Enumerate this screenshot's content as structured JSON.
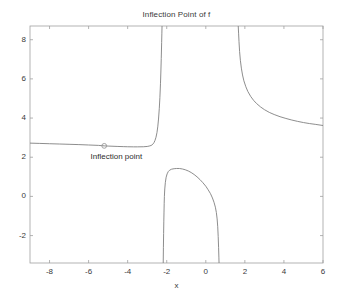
{
  "chart_data": {
    "type": "line",
    "title": "Inflection Point of f",
    "xlabel": "x",
    "ylabel": "",
    "xlim": [
      -9,
      6
    ],
    "ylim": [
      -3.4,
      8.7
    ],
    "grid": false,
    "legend": "none",
    "xticks": [
      -8,
      -6,
      -4,
      -2,
      0,
      2,
      4,
      6
    ],
    "xticklabels": [
      "-8",
      "-6",
      "-4",
      "-2",
      "0",
      "2",
      "4",
      "6"
    ],
    "yticks": [
      -2,
      0,
      2,
      4,
      6,
      8
    ],
    "yticklabels": [
      "-2",
      "0",
      "2",
      "4",
      "6",
      "8"
    ],
    "line_color": "#808080",
    "axis_color": "#a0a0a0",
    "text_color": "#3a3a3a",
    "background": "#ffffff",
    "annotations": [
      {
        "name": "inflection-point",
        "label": "Inflection point",
        "x": -5.2,
        "y": 2.58,
        "marker": "circle",
        "label_x": -5.9,
        "label_y": 2.0
      }
    ],
    "asymptotes": [
      -2.2,
      0.62,
      1.65
    ],
    "series": [
      {
        "name": "f-branch-left",
        "comment": "left branch: flat near y=2.7 then rises to +infinity at x=-2.2",
        "points": [
          [
            -9.0,
            2.72
          ],
          [
            -8.5,
            2.705
          ],
          [
            -8.0,
            2.69
          ],
          [
            -7.5,
            2.675
          ],
          [
            -7.0,
            2.66
          ],
          [
            -6.5,
            2.645
          ],
          [
            -6.0,
            2.625
          ],
          [
            -5.5,
            2.605
          ],
          [
            -5.2,
            2.58
          ],
          [
            -5.0,
            2.57
          ],
          [
            -4.5,
            2.55
          ],
          [
            -4.2,
            2.54
          ],
          [
            -4.0,
            2.535
          ],
          [
            -3.7,
            2.53
          ],
          [
            -3.5,
            2.53
          ],
          [
            -3.2,
            2.535
          ],
          [
            -3.0,
            2.55
          ],
          [
            -2.9,
            2.57
          ],
          [
            -2.8,
            2.6
          ],
          [
            -2.75,
            2.63
          ],
          [
            -2.7,
            2.68
          ],
          [
            -2.65,
            2.75
          ],
          [
            -2.6,
            2.86
          ],
          [
            -2.55,
            3.02
          ],
          [
            -2.5,
            3.26
          ],
          [
            -2.46,
            3.55
          ],
          [
            -2.42,
            3.95
          ],
          [
            -2.38,
            4.5
          ],
          [
            -2.35,
            5.05
          ],
          [
            -2.32,
            5.75
          ],
          [
            -2.3,
            6.35
          ],
          [
            -2.28,
            7.05
          ],
          [
            -2.26,
            7.85
          ],
          [
            -2.25,
            8.3
          ],
          [
            -2.24,
            8.7
          ]
        ]
      },
      {
        "name": "f-branch-middle",
        "comment": "middle hump between asymptotes x=-2.2 and x=0.62, peak ~1.42 at x=-1.35",
        "points": [
          [
            -2.18,
            -3.4
          ],
          [
            -2.17,
            -2.6
          ],
          [
            -2.16,
            -1.9
          ],
          [
            -2.15,
            -1.3
          ],
          [
            -2.14,
            -0.8
          ],
          [
            -2.13,
            -0.35
          ],
          [
            -2.12,
            0.0
          ],
          [
            -2.1,
            0.38
          ],
          [
            -2.07,
            0.72
          ],
          [
            -2.03,
            0.98
          ],
          [
            -1.98,
            1.15
          ],
          [
            -1.92,
            1.27
          ],
          [
            -1.85,
            1.34
          ],
          [
            -1.75,
            1.39
          ],
          [
            -1.62,
            1.415
          ],
          [
            -1.5,
            1.425
          ],
          [
            -1.35,
            1.425
          ],
          [
            -1.2,
            1.4
          ],
          [
            -1.05,
            1.36
          ],
          [
            -0.9,
            1.3
          ],
          [
            -0.75,
            1.22
          ],
          [
            -0.6,
            1.12
          ],
          [
            -0.45,
            1.0
          ],
          [
            -0.3,
            0.86
          ],
          [
            -0.15,
            0.7
          ],
          [
            0.0,
            0.52
          ],
          [
            0.12,
            0.34
          ],
          [
            0.24,
            0.14
          ],
          [
            0.34,
            -0.08
          ],
          [
            0.42,
            -0.3
          ],
          [
            0.49,
            -0.55
          ],
          [
            0.54,
            -0.82
          ],
          [
            0.58,
            -1.15
          ],
          [
            0.61,
            -1.55
          ],
          [
            0.635,
            -2.05
          ],
          [
            0.655,
            -2.6
          ],
          [
            0.67,
            -3.1
          ],
          [
            0.678,
            -3.4
          ]
        ]
      },
      {
        "name": "f-branch-right",
        "comment": "right branch: descends from +infinity at x=1.65 to y~3.62 at x=6",
        "points": [
          [
            1.66,
            8.7
          ],
          [
            1.68,
            8.3
          ],
          [
            1.7,
            7.9
          ],
          [
            1.73,
            7.4
          ],
          [
            1.77,
            6.95
          ],
          [
            1.82,
            6.55
          ],
          [
            1.88,
            6.2
          ],
          [
            1.95,
            5.9
          ],
          [
            2.05,
            5.6
          ],
          [
            2.15,
            5.36
          ],
          [
            2.3,
            5.1
          ],
          [
            2.45,
            4.9
          ],
          [
            2.6,
            4.74
          ],
          [
            2.8,
            4.57
          ],
          [
            3.0,
            4.43
          ],
          [
            3.25,
            4.29
          ],
          [
            3.5,
            4.18
          ],
          [
            3.8,
            4.07
          ],
          [
            4.1,
            3.98
          ],
          [
            4.4,
            3.9
          ],
          [
            4.7,
            3.83
          ],
          [
            5.0,
            3.77
          ],
          [
            5.3,
            3.72
          ],
          [
            5.6,
            3.68
          ],
          [
            6.0,
            3.62
          ]
        ]
      }
    ]
  }
}
